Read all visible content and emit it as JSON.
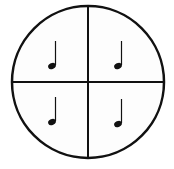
{
  "diagram": {
    "circle": {
      "cx": 88,
      "cy": 82,
      "r": 76,
      "stroke": "#111111",
      "fill": "#fdfdfd"
    },
    "quadrants": [
      {
        "position": "top-left",
        "symbol": "quarter-note"
      },
      {
        "position": "top-right",
        "symbol": "quarter-note"
      },
      {
        "position": "bottom-left",
        "symbol": "quarter-note"
      },
      {
        "position": "bottom-right",
        "symbol": "quarter-note"
      }
    ]
  }
}
